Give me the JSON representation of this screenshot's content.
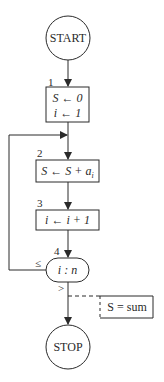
{
  "diagram": {
    "type": "flowchart",
    "nodes": [
      {
        "id": "start",
        "shape": "circle",
        "text": "START"
      },
      {
        "id": "1",
        "shape": "rect",
        "label": "1",
        "lines": [
          "S ← 0",
          "i ← 1"
        ]
      },
      {
        "id": "2",
        "shape": "rect",
        "label": "2",
        "text": "S ← S + a",
        "subscript": "i"
      },
      {
        "id": "3",
        "shape": "rect",
        "label": "3",
        "text": "i ← i + 1"
      },
      {
        "id": "4",
        "shape": "rounded",
        "label": "4",
        "text": "i : n"
      },
      {
        "id": "annotation",
        "shape": "open-rect",
        "text": "S = sum"
      },
      {
        "id": "stop",
        "shape": "circle",
        "text": "STOP"
      }
    ],
    "edges": [
      {
        "from": "start",
        "to": "1"
      },
      {
        "from": "1",
        "to": "2"
      },
      {
        "from": "2",
        "to": "3"
      },
      {
        "from": "3",
        "to": "4"
      },
      {
        "from": "4",
        "to": "2",
        "label": "≤"
      },
      {
        "from": "4",
        "to": "stop",
        "label": ">"
      },
      {
        "from": "4-stop-edge",
        "to": "annotation",
        "style": "dashed"
      }
    ],
    "colors": {
      "stroke": "#2a2a2a",
      "background": "#ffffff"
    }
  }
}
